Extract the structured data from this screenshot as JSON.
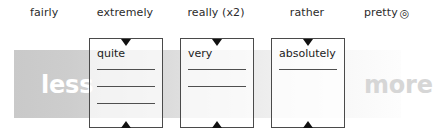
{
  "diagram": {
    "scale": {
      "left_word": "less",
      "right_word": "more",
      "left_color": "#ffffff",
      "right_color": "#d6d6d6",
      "band_start_color": "#c9c9c9",
      "band_end_color": "#fdfdfd"
    },
    "header_labels": [
      {
        "text": "fairly",
        "symbol": ""
      },
      {
        "text": "extremely",
        "symbol": ""
      },
      {
        "text": "really (x2)",
        "symbol": ""
      },
      {
        "text": "rather",
        "symbol": ""
      },
      {
        "text": "pretty",
        "symbol": "◎"
      }
    ],
    "boxes": [
      {
        "label": "quite",
        "blank_lines": 3
      },
      {
        "label": "very",
        "blank_lines": 2
      },
      {
        "label": "absolutely",
        "blank_lines": 1
      }
    ]
  }
}
